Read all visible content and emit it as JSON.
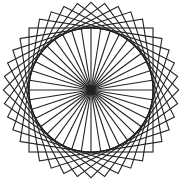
{
  "figure": {
    "square_count": 10,
    "rotation_step_degrees": 9,
    "spoke_count": 40,
    "stroke_color": "#222222",
    "background_color": "#ffffff"
  }
}
